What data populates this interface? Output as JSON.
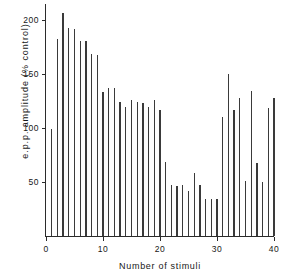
{
  "chart_data": {
    "type": "bar",
    "title": "",
    "xlabel": "Number of stimuli",
    "ylabel": "e.p.p. amplitude (% control)",
    "xlim": [
      0,
      40
    ],
    "ylim": [
      0,
      215
    ],
    "grid": false,
    "legend": null,
    "xticks": [
      0,
      10,
      20,
      30,
      40
    ],
    "yticks": [
      50,
      100,
      150,
      200
    ],
    "categories": [
      1,
      2,
      3,
      4,
      5,
      6,
      7,
      8,
      9,
      10,
      11,
      12,
      13,
      14,
      15,
      16,
      17,
      18,
      19,
      20,
      21,
      22,
      23,
      24,
      25,
      26,
      27,
      28,
      29,
      30,
      31,
      32,
      33,
      34,
      35,
      36,
      37,
      38,
      39,
      40
    ],
    "values": [
      99,
      183,
      207,
      193,
      192,
      181,
      181,
      169,
      168,
      133,
      137,
      137,
      124,
      120,
      126,
      124,
      123,
      120,
      126,
      117,
      69,
      47,
      46,
      47,
      42,
      58,
      47,
      34,
      34,
      34,
      110,
      150,
      117,
      128,
      51,
      134,
      68,
      50,
      119,
      128
    ],
    "series": [
      {
        "name": "e.p.p. amplitude",
        "values": [
          99,
          183,
          207,
          193,
          192,
          181,
          181,
          169,
          168,
          133,
          137,
          137,
          124,
          120,
          126,
          124,
          123,
          120,
          126,
          117,
          69,
          47,
          46,
          47,
          42,
          58,
          47,
          34,
          34,
          34,
          110,
          150,
          117,
          128,
          51,
          134,
          68,
          50,
          119,
          128
        ]
      }
    ]
  },
  "axes": {
    "y_label": "e.p.p. amplitude (% control)",
    "x_label": "Number of stimuli",
    "y_tick_labels": [
      "200",
      "150",
      "100",
      "50"
    ],
    "x_tick_labels": [
      "0",
      "10",
      "20",
      "30",
      "40"
    ]
  },
  "colors": {
    "bar": "#3a3a3a",
    "axis": "#2b2b2b",
    "text": "#171717",
    "background": "#ffffff"
  }
}
